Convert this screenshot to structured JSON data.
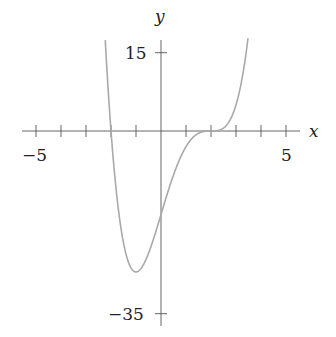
{
  "chart_data": {
    "type": "line",
    "title": "",
    "xlabel": "x",
    "ylabel": "y",
    "function": "(x-2)^3 (x+2)",
    "xlim": [
      -5.5,
      5.5
    ],
    "ylim": [
      -37,
      18
    ],
    "x_ticks": [
      -5,
      -4,
      -3,
      -2,
      -1,
      0,
      1,
      2,
      3,
      4,
      5
    ],
    "x_tick_labels": {
      "-5": "−5",
      "5": "5"
    },
    "y_ticks": [
      15,
      -35
    ],
    "y_tick_labels": {
      "15": "15",
      "-35": "−35"
    },
    "grid": false,
    "series": [
      {
        "name": "f(x)",
        "color": "#a9a9a9",
        "x": [
          -2.3,
          -2.0,
          -1.5,
          -1.0,
          -0.5,
          0,
          0.5,
          1.0,
          1.5,
          2.0,
          2.5,
          3.0,
          3.3,
          3.5
        ],
        "values": [
          18.4,
          0,
          -21.4,
          -27,
          -23.4,
          -16,
          -8.4,
          -3,
          -0.4,
          0,
          0.6,
          5,
          11.8,
          18.6
        ]
      }
    ],
    "key_points": {
      "minimum": [
        -1,
        -27
      ],
      "y_intercept": [
        0,
        -16
      ],
      "roots": [
        -2,
        2
      ],
      "inflection_flat": [
        2,
        0
      ]
    }
  },
  "labels": {
    "x_axis": "x",
    "y_axis": "y",
    "x_min": "−5",
    "x_max": "5",
    "y_top": "15",
    "y_bottom": "−35"
  },
  "colors": {
    "axis": "#555555",
    "curve": "#a9a9a9",
    "text": "#222222"
  }
}
